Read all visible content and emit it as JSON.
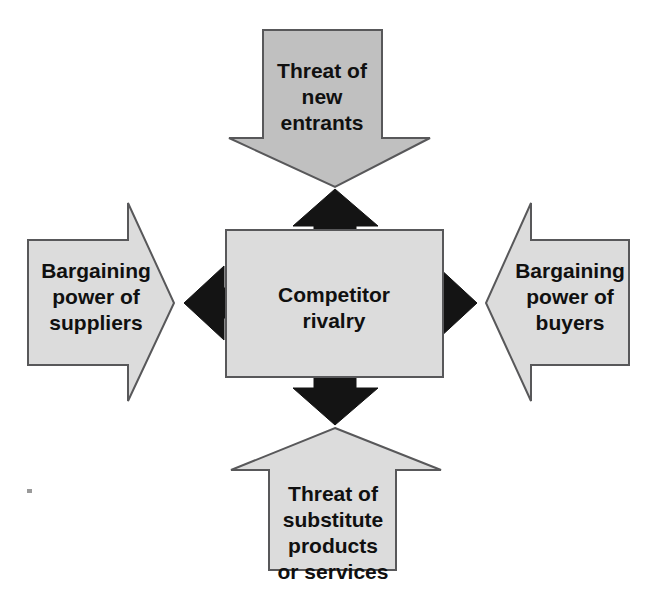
{
  "diagram": {
    "type": "five-forces-arrow-diagram",
    "background_color": "#ffffff",
    "center": {
      "id": "competitor-rivalry",
      "label_line1": "Competitor",
      "label_line2": "rivalry",
      "shape": "rectangle",
      "fill_color": "#dcdcdc",
      "border_color": "#58585a"
    },
    "forces": [
      {
        "id": "threat-of-new-entrants",
        "position": "top",
        "direction": "down",
        "shape": "arrow",
        "fill_color": "#c0c0c0",
        "border_color": "#58585a",
        "label_line1": "Threat of",
        "label_line2": "new",
        "label_line3": "entrants"
      },
      {
        "id": "bargaining-power-of-suppliers",
        "position": "left",
        "direction": "right",
        "shape": "arrow",
        "fill_color": "#dcdcdc",
        "border_color": "#58585a",
        "label_line1": "Bargaining",
        "label_line2": "power of",
        "label_line3": "suppliers"
      },
      {
        "id": "bargaining-power-of-buyers",
        "position": "right",
        "direction": "left",
        "shape": "arrow",
        "fill_color": "#dcdcdc",
        "border_color": "#58585a",
        "label_line1": "Bargaining",
        "label_line2": "power of",
        "label_line3": "buyers"
      },
      {
        "id": "threat-of-substitute-products-or-services",
        "position": "bottom",
        "direction": "up",
        "shape": "arrow",
        "fill_color": "#dcdcdc",
        "border_color": "#58585a",
        "label_line1": "Threat of",
        "label_line2": "substitute",
        "label_line3": "products",
        "label_line4": "or services"
      }
    ],
    "connectors": [
      {
        "id": "connector-up",
        "direction": "up",
        "color": "#141414"
      },
      {
        "id": "connector-left",
        "direction": "left",
        "color": "#141414"
      },
      {
        "id": "connector-right",
        "direction": "right",
        "color": "#141414"
      },
      {
        "id": "connector-down",
        "direction": "down",
        "color": "#141414"
      }
    ]
  }
}
